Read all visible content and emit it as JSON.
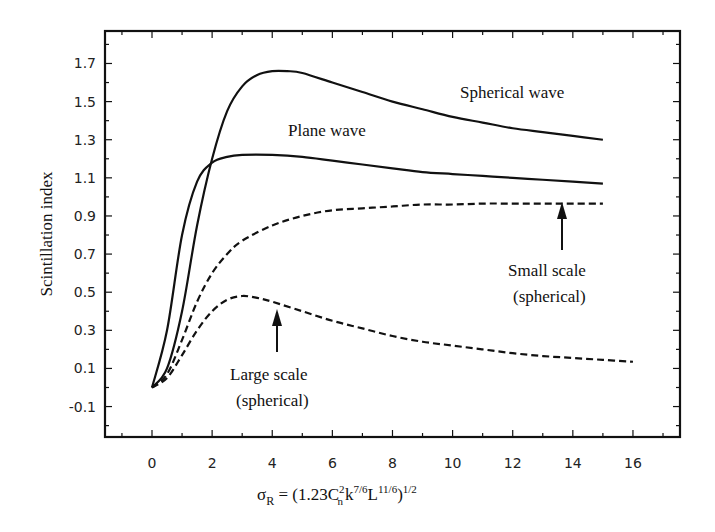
{
  "chart_data": {
    "type": "line",
    "title": "",
    "xlabel": "σR = (1.23 Cn² k^(7/6) L^(11/6))^(1/2)",
    "ylabel": "Scintillation index",
    "xlim": [
      -1.6,
      17.6
    ],
    "ylim": [
      -0.28,
      1.9
    ],
    "xticks": [
      0,
      2,
      4,
      6,
      8,
      10,
      12,
      14,
      16
    ],
    "yticks": [
      -0.1,
      0.1,
      0.3,
      0.5,
      0.7,
      0.9,
      1.1,
      1.3,
      1.5,
      1.7
    ],
    "grid": false,
    "legend": "none (inline annotations)",
    "series": [
      {
        "name": "Spherical wave",
        "style": "solid",
        "x": [
          0,
          0.5,
          1,
          1.5,
          2,
          2.5,
          3,
          3.5,
          4,
          4.5,
          5,
          6,
          7,
          8,
          9,
          10,
          11,
          12,
          13,
          14,
          15
        ],
        "y": [
          0.0,
          0.1,
          0.4,
          0.85,
          1.2,
          1.45,
          1.58,
          1.64,
          1.66,
          1.66,
          1.65,
          1.6,
          1.55,
          1.5,
          1.46,
          1.42,
          1.39,
          1.36,
          1.34,
          1.32,
          1.3
        ]
      },
      {
        "name": "Plane wave",
        "style": "solid",
        "x": [
          0,
          0.5,
          1,
          1.5,
          2,
          2.5,
          3,
          4,
          5,
          6,
          7,
          8,
          9,
          10,
          11,
          12,
          13,
          14,
          15
        ],
        "y": [
          0.0,
          0.3,
          0.8,
          1.08,
          1.18,
          1.21,
          1.22,
          1.22,
          1.21,
          1.19,
          1.17,
          1.15,
          1.13,
          1.12,
          1.11,
          1.1,
          1.09,
          1.08,
          1.07
        ]
      },
      {
        "name": "Small scale (spherical)",
        "style": "dashed",
        "x": [
          0,
          0.5,
          1,
          1.5,
          2,
          2.5,
          3,
          4,
          5,
          6,
          7,
          8,
          9,
          10,
          11,
          12,
          13,
          14,
          15
        ],
        "y": [
          0.0,
          0.07,
          0.25,
          0.45,
          0.6,
          0.7,
          0.77,
          0.85,
          0.9,
          0.93,
          0.94,
          0.95,
          0.96,
          0.96,
          0.965,
          0.965,
          0.965,
          0.965,
          0.965
        ]
      },
      {
        "name": "Large scale (spherical)",
        "style": "dashed",
        "x": [
          0,
          0.5,
          1,
          1.5,
          2,
          2.5,
          3,
          3.5,
          4,
          5,
          6,
          7,
          8,
          9,
          10,
          11,
          12,
          13,
          14,
          15,
          16
        ],
        "y": [
          0.0,
          0.05,
          0.17,
          0.3,
          0.4,
          0.46,
          0.48,
          0.47,
          0.45,
          0.4,
          0.35,
          0.31,
          0.27,
          0.24,
          0.22,
          0.2,
          0.18,
          0.165,
          0.155,
          0.145,
          0.135
        ]
      }
    ],
    "annotations": [
      {
        "text": "Spherical wave",
        "x": 10.6,
        "y": 1.6
      },
      {
        "text": "Plane wave",
        "x": 5.0,
        "y": 1.35
      },
      {
        "text": "Small scale",
        "line2": "(spherical)",
        "x": 13.3,
        "y": 0.62,
        "arrow_to": [
          13.7,
          0.965
        ]
      },
      {
        "text": "Large scale",
        "line2": "(spherical)",
        "x": 4.2,
        "y": 0.12,
        "arrow_to": [
          4.2,
          0.45
        ]
      }
    ]
  },
  "labels": {
    "ylabel": "Scintillation index",
    "xlabel_sigma": "σ",
    "xlabel_sub": "R",
    "xlabel_eq": " = (1.23C",
    "xlabel_n": "n",
    "xlabel_2": "2",
    "xlabel_k": "k",
    "xlabel_k_exp": "7/6",
    "xlabel_L": "L",
    "xlabel_L_exp": "11/6",
    "xlabel_close": ")",
    "xlabel_close_exp": "1/2",
    "spherical_wave": "Spherical wave",
    "plane_wave": "Plane wave",
    "small_scale_1": "Small scale",
    "small_scale_2": "(spherical)",
    "large_scale_1": "Large scale",
    "large_scale_2": "(spherical)"
  },
  "style": {
    "line_color": "#111111",
    "axis_color": "#111111",
    "background": "#ffffff"
  }
}
